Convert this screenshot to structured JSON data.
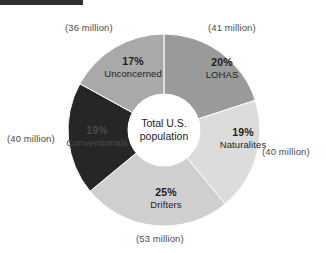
{
  "header": {
    "bar_color": "#2f2f2f"
  },
  "center": {
    "line1": "Total U.S.",
    "line2": "population"
  },
  "chart_data": {
    "type": "pie",
    "title": "Total U.S. population",
    "subtitle": "",
    "xlabel": "",
    "ylabel": "",
    "legend_position": "none",
    "grid": false,
    "donut": true,
    "inner_radius_ratio": 0.37,
    "start_angle_deg": 0,
    "direction": "clockwise",
    "unit": "percent of total U.S. population",
    "categories": [
      "LOHAS",
      "Naturalites",
      "Drifters",
      "Conventionals",
      "Unconcerned"
    ],
    "values": [
      20,
      19,
      25,
      19,
      17
    ],
    "labels": [
      "20%",
      "19%",
      "25%",
      "19%",
      "17%"
    ],
    "annotations": [
      "(41 million)",
      "(40 million)",
      "(53 million)",
      "(40 million)",
      "(36 million)"
    ],
    "absolute_millions": [
      41,
      40,
      53,
      40,
      36
    ],
    "colors": [
      "#9a9a9a",
      "#dcdcdc",
      "#cfcfcf",
      "#262626",
      "#a9a9a9"
    ],
    "slices": [
      {
        "name": "LOHAS",
        "percent_label": "20%",
        "value": 20,
        "callout": "(41 million)",
        "millions": 41,
        "color": "#9a9a9a",
        "start_deg": 0,
        "end_deg": 72
      },
      {
        "name": "Naturalites",
        "percent_label": "19%",
        "value": 19,
        "callout": "(40 million)",
        "millions": 40,
        "color": "#dcdcdc",
        "start_deg": 72,
        "end_deg": 140.4
      },
      {
        "name": "Drifters",
        "percent_label": "25%",
        "value": 25,
        "callout": "(53 million)",
        "millions": 53,
        "color": "#cfcfcf",
        "start_deg": 140.4,
        "end_deg": 230.4
      },
      {
        "name": "Conventionals",
        "percent_label": "19%",
        "value": 19,
        "callout": "(40 million)",
        "millions": 40,
        "color": "#262626",
        "start_deg": 230.4,
        "end_deg": 298.8
      },
      {
        "name": "Unconcerned",
        "percent_label": "17%",
        "value": 17,
        "callout": "(36 million)",
        "millions": 36,
        "color": "#a9a9a9",
        "start_deg": 298.8,
        "end_deg": 360
      }
    ]
  }
}
